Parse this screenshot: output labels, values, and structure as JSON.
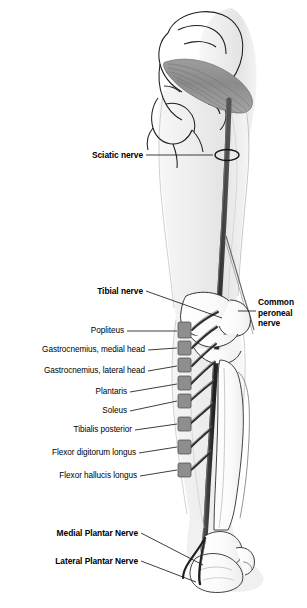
{
  "figure": {
    "background_color": "#ffffff",
    "outline_color": "#1a1a1a",
    "nerve_color": "#2b2b2b",
    "muscle_color": "#8a8a8a",
    "limb_fill_light": "#f2f2f2",
    "limb_fill_mid": "#e0e0e0",
    "bone_fill": "#fbfbfb"
  },
  "labels": {
    "sciatic_nerve": "Sciatic nerve",
    "tibial_nerve": "Tibial nerve",
    "common_peroneal_nerve": "Common peroneal nerve",
    "popliteus": "Popliteus",
    "gastrocnemius_medial": "Gastrocnemius, medial head",
    "gastrocnemius_lateral": "Gastrocnemius, lateral head",
    "plantaris": "Plantaris",
    "soleus": "Soleus",
    "tibialis_posterior": "Tibialis posterior",
    "flexor_digitorum_longus": "Flexor digitorum longus",
    "flexor_hallucis_longus": "Flexor hallucis longus",
    "medial_plantar_nerve": "Medial Plantar Nerve",
    "lateral_plantar_nerve": "Lateral Plantar Nerve"
  },
  "structures": {
    "piriformis_muscle": "piriformis-muscle",
    "pelvis_bone": "pelvis-bone",
    "femur_region": "femur-region",
    "tibia_bone": "tibia-bone",
    "fibula_bone": "fibula-bone",
    "calcaneus_bone": "calcaneus-bone",
    "foot_outline": "foot-outline",
    "sciatic_marker": "sciatic-nerve-marker-ellipse"
  },
  "branch_count": 8
}
